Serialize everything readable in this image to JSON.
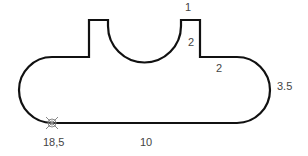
{
  "diagram": {
    "type": "dimensioned-profile-outline",
    "stroke_color": "#111111",
    "label_color": "#444444",
    "marker_color": "#888888",
    "labels": [
      {
        "id": "top-tab-width",
        "text": "1",
        "x": 188,
        "y": 11
      },
      {
        "id": "tab-height",
        "text": "2",
        "x": 191,
        "y": 45
      },
      {
        "id": "step-length",
        "text": "2",
        "x": 219,
        "y": 71
      },
      {
        "id": "end-radius",
        "text": "3.5",
        "x": 278,
        "y": 90
      },
      {
        "id": "start-point",
        "text": "18,5",
        "x": 43,
        "y": 145
      },
      {
        "id": "bottom-length",
        "text": "10",
        "x": 141,
        "y": 145
      }
    ],
    "start_marker": {
      "x": 52,
      "y": 123,
      "symbol": "crossed-circle"
    }
  }
}
